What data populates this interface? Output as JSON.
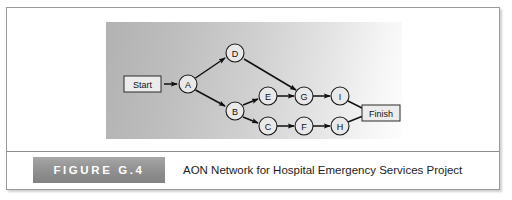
{
  "figure": {
    "number_label": "FIGURE G.4",
    "caption": "AON Network for Hospital Emergency Services Project"
  },
  "diagram": {
    "type": "activity-on-node-network",
    "terminals": [
      {
        "id": "start",
        "label": "Start",
        "x": 40,
        "y": 62
      },
      {
        "id": "finish",
        "label": "Finish",
        "x": 274,
        "y": 91
      }
    ],
    "nodes": [
      {
        "id": "A",
        "label": "A",
        "x": 82,
        "y": 62
      },
      {
        "id": "D",
        "label": "D",
        "x": 129,
        "y": 31
      },
      {
        "id": "B",
        "label": "B",
        "x": 129,
        "y": 89
      },
      {
        "id": "E",
        "label": "E",
        "x": 162,
        "y": 74
      },
      {
        "id": "C",
        "label": "C",
        "x": 162,
        "y": 104
      },
      {
        "id": "G",
        "label": "G",
        "x": 198,
        "y": 74
      },
      {
        "id": "F",
        "label": "F",
        "x": 198,
        "y": 104
      },
      {
        "id": "I",
        "label": "I",
        "x": 234,
        "y": 74
      },
      {
        "id": "H",
        "label": "H",
        "x": 234,
        "y": 104
      }
    ],
    "edges": [
      {
        "from": "start",
        "to": "A"
      },
      {
        "from": "A",
        "to": "D"
      },
      {
        "from": "A",
        "to": "B"
      },
      {
        "from": "D",
        "to": "G"
      },
      {
        "from": "B",
        "to": "E"
      },
      {
        "from": "B",
        "to": "C"
      },
      {
        "from": "E",
        "to": "G"
      },
      {
        "from": "G",
        "to": "I"
      },
      {
        "from": "C",
        "to": "F"
      },
      {
        "from": "F",
        "to": "H"
      },
      {
        "from": "I",
        "to": "finish"
      },
      {
        "from": "H",
        "to": "finish"
      }
    ],
    "colors": {
      "panel_left": "#b2b2b2",
      "panel_right": "#fdfdfd",
      "node_fill": "#e9e9e9",
      "node_stroke": "#1a1a1a",
      "edge": "#101010",
      "figure_block": "#8f8f8f"
    }
  }
}
